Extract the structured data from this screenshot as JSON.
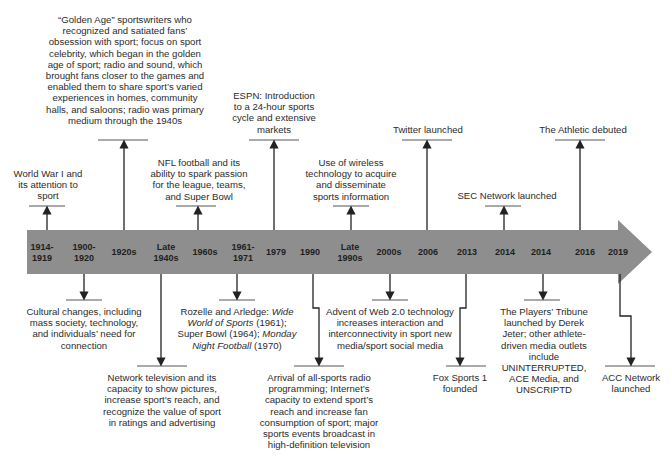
{
  "colors": {
    "band": "#8e8e8e",
    "line": "#333333",
    "text": "#2b2b2b"
  },
  "timeline_years": [
    {
      "label": "1914-\n1919",
      "x": 42
    },
    {
      "label": "1900-\n1920",
      "x": 84
    },
    {
      "label": "1920s",
      "x": 124
    },
    {
      "label": "Late\n1940s",
      "x": 166
    },
    {
      "label": "1960s",
      "x": 205
    },
    {
      "label": "1961-\n1971",
      "x": 243
    },
    {
      "label": "1979",
      "x": 276
    },
    {
      "label": "1990",
      "x": 310
    },
    {
      "label": "Late\n1990s",
      "x": 350
    },
    {
      "label": "2000s",
      "x": 389
    },
    {
      "label": "2006",
      "x": 428
    },
    {
      "label": "2013",
      "x": 467
    },
    {
      "label": "2014",
      "x": 505
    },
    {
      "label": "2014",
      "x": 541
    },
    {
      "label": "2016",
      "x": 585
    },
    {
      "label": "2019",
      "x": 618
    }
  ],
  "events_above": [
    {
      "id": "ww1",
      "text": "World War I and its attention to sport"
    },
    {
      "id": "golden_age",
      "text": "“Golden Age” sportswriters who recognized and satiated fans’ obsession with sport; focus on sport celebrity, which began in the golden age of sport; radio and sound, which brought fans closer to the games and enabled them to share sport’s varied experiences in homes, community halls, and saloons; radio was primary medium through the 1940s"
    },
    {
      "id": "nfl",
      "text": "NFL football and its ability to spark passion for the league, teams, and Super Bowl"
    },
    {
      "id": "espn",
      "text": "ESPN: Introduction to a 24-hour sports cycle and extensive markets"
    },
    {
      "id": "wireless",
      "text": "Use of wireless technology to acquire and disseminate sports information"
    },
    {
      "id": "twitter",
      "text": "Twitter launched"
    },
    {
      "id": "sec",
      "text": "SEC Network launched"
    },
    {
      "id": "athletic",
      "text": "The Athletic debuted"
    }
  ],
  "events_below": [
    {
      "id": "cultural",
      "text": "Cultural changes, including mass society, technology, and individuals’ need for connection"
    },
    {
      "id": "network_tv",
      "text": "Network television and its capacity to show pictures, increase sport’s reach, and recognize the value of sport in ratings and advertising"
    },
    {
      "id": "rozelle",
      "parts": [
        "Rozelle and Arledge: ",
        "Wide World of Sports",
        " (1961); Super Bowl (1964); ",
        "Monday Night Football",
        " (1970)"
      ]
    },
    {
      "id": "all_sports_radio",
      "text": "Arrival of all-sports radio programming; Internet’s capacity to extend sport’s reach and increase fan consumption of sport; major sports events broadcast in high-definition television"
    },
    {
      "id": "web2",
      "text": "Advent of Web 2.0 technology increases interaction and interconnectivity in sport new media/sport social media"
    },
    {
      "id": "fox1",
      "text": "Fox Sports 1 founded"
    },
    {
      "id": "players_tribune",
      "text": "The Players’ Tribune launched by Derek Jeter;  other athlete-driven media outlets include UNINTERRUPTED, ACE  Media, and UNSCRIPTD"
    },
    {
      "id": "acc",
      "text": "ACC Network launched"
    }
  ]
}
